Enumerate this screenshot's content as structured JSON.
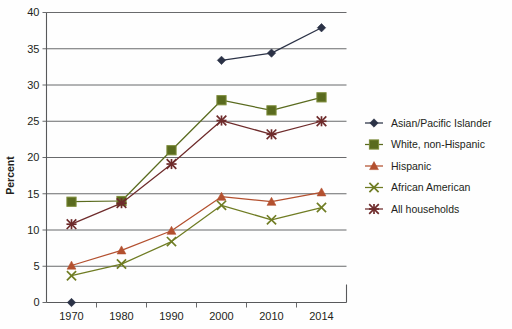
{
  "chart_data": {
    "type": "line",
    "title": "",
    "subtitle": "",
    "xlabel": "",
    "ylabel": "Percent",
    "x": [
      "1970",
      "1980",
      "1990",
      "2000",
      "2010",
      "2014"
    ],
    "categories": [
      "1970",
      "1980",
      "1990",
      "2000",
      "2010",
      "2014"
    ],
    "xtick_labels": [
      "1970",
      "1980",
      "1990",
      "2000",
      "2010",
      "2014"
    ],
    "ytick_labels": [
      "0",
      "5",
      "10",
      "15",
      "20",
      "25",
      "30",
      "35",
      "40"
    ],
    "ylim": [
      0,
      40
    ],
    "ytick_step": 5,
    "grid": "horizontal",
    "legend_position": "right",
    "series": [
      {
        "name": "Asian/Pacific Islander",
        "color": "#2b3246",
        "marker": "diamond",
        "values": [
          0.0,
          null,
          null,
          33.4,
          34.4,
          37.9
        ]
      },
      {
        "name": "White, non-Hispanic",
        "color": "#5a6b1f",
        "marker": "square",
        "values": [
          13.9,
          14.0,
          21.0,
          27.9,
          26.5,
          28.3
        ]
      },
      {
        "name": "Hispanic",
        "color": "#b3502f",
        "marker": "triangle",
        "values": [
          5.1,
          7.2,
          9.9,
          14.6,
          13.9,
          15.2
        ]
      },
      {
        "name": "African American",
        "color": "#6f7c23",
        "marker": "x",
        "values": [
          3.7,
          5.3,
          8.4,
          13.4,
          11.4,
          13.1
        ]
      },
      {
        "name": "All households",
        "color": "#6e2b2b",
        "marker": "star",
        "values": [
          10.8,
          13.7,
          19.1,
          25.1,
          23.2,
          25.0
        ]
      }
    ]
  },
  "legend": {
    "entries": [
      {
        "label": "Asian/Pacific Islander"
      },
      {
        "label": "White, non-Hispanic"
      },
      {
        "label": "Hispanic"
      },
      {
        "label": "African American"
      },
      {
        "label": "All households"
      }
    ]
  },
  "axis": {
    "y_title": "Percent"
  },
  "colors": {
    "asian": "#2b3246",
    "white": "#5a6b1f",
    "hispanic": "#b3502f",
    "african_american": "#6f7c23",
    "all_households": "#6e2b2b",
    "gridline": "#58595b",
    "axis": "#58595b",
    "background": "#fefefe"
  }
}
